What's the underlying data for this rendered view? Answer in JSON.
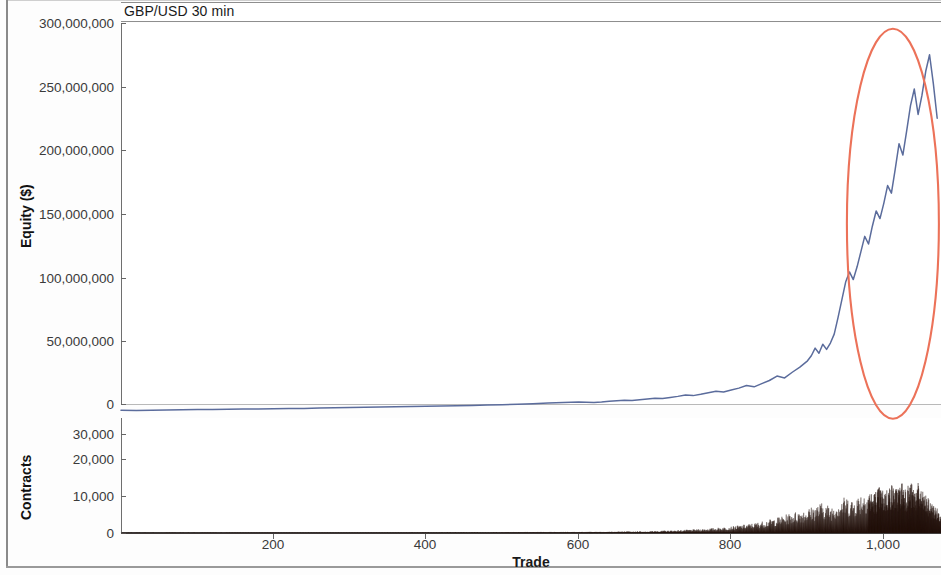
{
  "window": {
    "title": "GBP/USD 30 min"
  },
  "chart_data": {
    "type": "line",
    "title": "GBP/USD 30 min",
    "xlabel": "Trade",
    "ylabel": "Equity ($)",
    "xlim": [
      0,
      1075
    ],
    "xticks": [
      200,
      400,
      600,
      800,
      1000
    ],
    "xticklabels": [
      "200",
      "400",
      "600",
      "800",
      "1,000"
    ],
    "grid": false,
    "legend": false,
    "panels": [
      {
        "name": "equity-panel",
        "ylabel": "Equity ($)",
        "ylim": [
          0,
          300000000
        ],
        "yticks": [
          0,
          50000000,
          100000000,
          150000000,
          200000000,
          250000000,
          300000000
        ],
        "yticklabels": [
          "0",
          "50,000,000",
          "100,000,000",
          "150,000,000",
          "200,000,000",
          "250,000,000",
          "300,000,000"
        ],
        "series": [
          {
            "name": "Equity",
            "color": "#5b6c9c",
            "x": [
              0,
              20,
              40,
              60,
              80,
              100,
              120,
              140,
              160,
              180,
              200,
              220,
              240,
              260,
              280,
              300,
              320,
              340,
              360,
              380,
              400,
              420,
              440,
              460,
              480,
              500,
              520,
              540,
              560,
              580,
              600,
              610,
              620,
              630,
              640,
              650,
              660,
              670,
              680,
              690,
              700,
              710,
              720,
              730,
              740,
              750,
              760,
              770,
              780,
              790,
              800,
              810,
              820,
              830,
              840,
              850,
              860,
              870,
              880,
              890,
              900,
              905,
              910,
              915,
              920,
              925,
              930,
              935,
              940,
              945,
              950,
              955,
              960,
              965,
              970,
              975,
              980,
              985,
              990,
              995,
              1000,
              1005,
              1010,
              1015,
              1020,
              1025,
              1030,
              1035,
              1040,
              1045,
              1050,
              1055,
              1060,
              1065,
              1070,
              1075
            ],
            "y": [
              -5000000,
              -5200000,
              -5000000,
              -4800000,
              -4600000,
              -4400000,
              -4300000,
              -4200000,
              -4000000,
              -3900000,
              -3800000,
              -3600000,
              -3500000,
              -3200000,
              -3000000,
              -2800000,
              -2600000,
              -2400000,
              -2200000,
              -2000000,
              -1800000,
              -1600000,
              -1400000,
              -1100000,
              -800000,
              -500000,
              -200000,
              200000,
              700000,
              1200000,
              1600000,
              1400000,
              1200000,
              1600000,
              2200000,
              2600000,
              3000000,
              2800000,
              3400000,
              4000000,
              4600000,
              4400000,
              5200000,
              6000000,
              7000000,
              6600000,
              7600000,
              8800000,
              10000000,
              9400000,
              11000000,
              12500000,
              14500000,
              13500000,
              16000000,
              18500000,
              22000000,
              20500000,
              25000000,
              29000000,
              34000000,
              38000000,
              44000000,
              40000000,
              47000000,
              43000000,
              48000000,
              55000000,
              68000000,
              82000000,
              96000000,
              104000000,
              98000000,
              108000000,
              120000000,
              132000000,
              126000000,
              140000000,
              152000000,
              146000000,
              158000000,
              172000000,
              166000000,
              185000000,
              205000000,
              196000000,
              215000000,
              235000000,
              248000000,
              228000000,
              243000000,
              262000000,
              275000000,
              252000000,
              225000000
            ]
          }
        ],
        "annotations": [
          {
            "type": "ellipse",
            "name": "highlight-ellipse",
            "color": "#ec7259",
            "center_x": 1012,
            "center_y": 142000000,
            "note": "hand-drawn red ellipse highlighting the final parabolic run-up"
          }
        ]
      },
      {
        "name": "contracts-panel",
        "ylabel": "Contracts",
        "ylim": [
          0,
          34000
        ],
        "yticks": [
          0,
          10000,
          20000,
          30000
        ],
        "yticklabels": [
          "0",
          "10,000",
          "20,000",
          "30,000"
        ],
        "type": "area",
        "series": [
          {
            "name": "Contracts",
            "color": "#24120c",
            "x": [
              0,
              50,
              100,
              150,
              200,
              250,
              300,
              350,
              400,
              450,
              500,
              520,
              540,
              560,
              580,
              600,
              620,
              640,
              660,
              680,
              700,
              710,
              720,
              730,
              740,
              750,
              760,
              770,
              780,
              790,
              800,
              810,
              820,
              830,
              840,
              850,
              860,
              870,
              880,
              890,
              900,
              910,
              920,
              930,
              940,
              950,
              960,
              970,
              980,
              985,
              990,
              995,
              1000,
              1005,
              1010,
              1015,
              1020,
              1025,
              1030,
              1035,
              1040,
              1045,
              1050,
              1055,
              1060,
              1065,
              1070,
              1075
            ],
            "y": [
              60,
              70,
              80,
              90,
              100,
              120,
              130,
              150,
              170,
              200,
              230,
              260,
              300,
              340,
              380,
              420,
              480,
              540,
              620,
              700,
              800,
              880,
              950,
              1050,
              1200,
              1350,
              1500,
              1700,
              1950,
              2200,
              2500,
              2900,
              3300,
              3800,
              4400,
              5100,
              5900,
              6800,
              7800,
              8600,
              9400,
              10500,
              11800,
              10200,
              12500,
              14000,
              13000,
              15500,
              17000,
              15000,
              16500,
              18000,
              16000,
              17500,
              19000,
              17000,
              18500,
              20200,
              18000,
              19500,
              17500,
              19000,
              16000,
              14500,
              12500,
              11000,
              9500,
              8000
            ]
          }
        ]
      }
    ]
  },
  "axes": {
    "equity_yticklabels": [
      "300,000,000",
      "250,000,000",
      "200,000,000",
      "150,000,000",
      "100,000,000",
      "50,000,000",
      "0"
    ],
    "contracts_yticklabels": [
      "30,000",
      "20,000",
      "10,000",
      "0"
    ],
    "xticklabels": [
      "200",
      "400",
      "600",
      "800",
      "1,000"
    ],
    "equity_axis_title": "Equity ($)",
    "contracts_axis_title": "Contracts",
    "x_axis_title": "Trade"
  }
}
